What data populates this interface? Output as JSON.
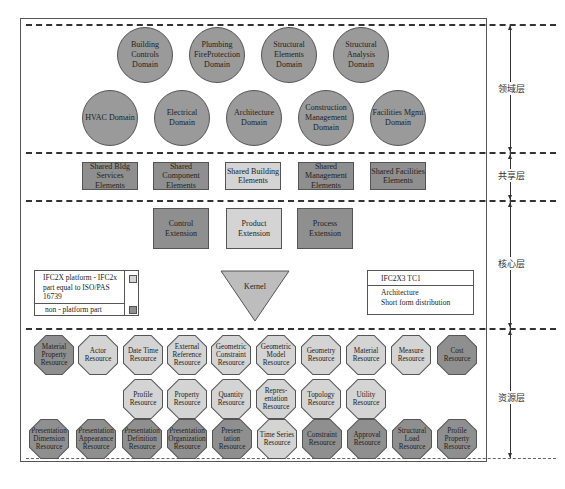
{
  "layers": [
    {
      "label": "领域层",
      "name": "domain-layer"
    },
    {
      "label": "共享层",
      "name": "shared-layer"
    },
    {
      "label": "核心层",
      "name": "core-layer"
    },
    {
      "label": "资源层",
      "name": "resource-layer"
    }
  ],
  "domain": {
    "row1": [
      "Building Controls Domain",
      "Plumbing FireProtection Domain",
      "Structural Elements Domain",
      "Structural Analysis Domain"
    ],
    "row2": [
      "HVAC Domain",
      "Electrical Domain",
      "Architecture Domain",
      "Construction Management Domain",
      "Facilities Mgmt Domain"
    ]
  },
  "shared": [
    {
      "label": "Shared Bldg Services Elements",
      "shade": "dark"
    },
    {
      "label": "Shared Component Elements",
      "shade": "dark"
    },
    {
      "label": "Shared Building Elements",
      "shade": "light"
    },
    {
      "label": "Shared Management Elements",
      "shade": "dark"
    },
    {
      "label": "Shared Facilities Elements",
      "shade": "dark"
    }
  ],
  "core": {
    "extensions": [
      {
        "label": "Control Extension",
        "shade": "dark"
      },
      {
        "label": "Product Extension",
        "shade": "light"
      },
      {
        "label": "Process Extension",
        "shade": "dark"
      }
    ],
    "kernel": "Kernel"
  },
  "legend": {
    "platform": "IFC2X  platform - IFC2x part equal to ISO/PAS 16739",
    "non_platform": "non - platform part",
    "platform_color": "#d4d4d4",
    "non_platform_color": "#8f8f8f"
  },
  "ifc_box": {
    "title": "IFC2X3 TC1",
    "line1": "Architecture",
    "line2": "Short form distribution"
  },
  "resources": {
    "row1": [
      {
        "label": "Material Property Resource",
        "shade": "dark"
      },
      {
        "label": "Actor Resource",
        "shade": "light"
      },
      {
        "label": "Date Time Resource",
        "shade": "light"
      },
      {
        "label": "External Reference Resource",
        "shade": "light"
      },
      {
        "label": "Geometric Constraint Resource",
        "shade": "light"
      },
      {
        "label": "Geometric Model Resource",
        "shade": "light"
      },
      {
        "label": "Geometry Resource",
        "shade": "light"
      },
      {
        "label": "Material Resource",
        "shade": "light"
      },
      {
        "label": "Measure Resource",
        "shade": "light"
      },
      {
        "label": "Cost Resource",
        "shade": "dark"
      }
    ],
    "row2": [
      {
        "label": "Profile Resource",
        "shade": "light"
      },
      {
        "label": "Property Resource",
        "shade": "light"
      },
      {
        "label": "Quantity Resource",
        "shade": "light"
      },
      {
        "label": "Repres- entation Resource",
        "shade": "light"
      },
      {
        "label": "Topology Resource",
        "shade": "light"
      },
      {
        "label": "Utility Resource",
        "shade": "light"
      }
    ],
    "row3": [
      {
        "label": "Presentation Dimension Resource",
        "shade": "dark"
      },
      {
        "label": "Presentation Appearance Resource",
        "shade": "dark"
      },
      {
        "label": "Presentation Definition Resource",
        "shade": "dark"
      },
      {
        "label": "Presentation Organization Resource",
        "shade": "dark"
      },
      {
        "label": "Presen- tation Resource",
        "shade": "dark"
      },
      {
        "label": "Time Series Resource",
        "shade": "light"
      },
      {
        "label": "Constraint Resource",
        "shade": "dark"
      },
      {
        "label": "Approval Resource",
        "shade": "dark"
      },
      {
        "label": "Structural Load Resource",
        "shade": "dark"
      },
      {
        "label": "Profile Property Resource",
        "shade": "dark"
      }
    ]
  }
}
